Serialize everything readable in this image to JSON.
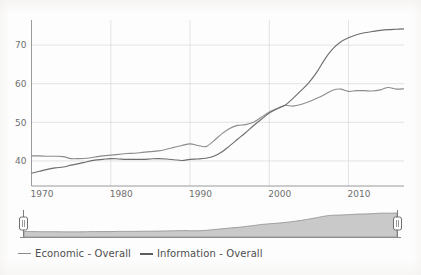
{
  "chart_data": {
    "type": "line",
    "title": "",
    "subtitle": "",
    "xlabel": "",
    "ylabel": "",
    "xlim": [
      1970,
      2017
    ],
    "ylim": [
      33.5,
      76.5
    ],
    "grid": true,
    "legend_position": "bottom-left",
    "x_ticks": [
      "1970",
      "1980",
      "1990",
      "2000",
      "2010"
    ],
    "x_tick_values": [
      1970,
      1980,
      1990,
      2000,
      2010
    ],
    "y_ticks": [
      "40",
      "50",
      "60",
      "70"
    ],
    "y_tick_values": [
      40,
      50,
      60,
      70
    ],
    "x": [
      1970,
      1971,
      1972,
      1973,
      1974,
      1975,
      1976,
      1977,
      1978,
      1979,
      1980,
      1981,
      1982,
      1983,
      1984,
      1985,
      1986,
      1987,
      1988,
      1989,
      1990,
      1991,
      1992,
      1993,
      1994,
      1995,
      1996,
      1997,
      1998,
      1999,
      2000,
      2001,
      2002,
      2003,
      2004,
      2005,
      2006,
      2007,
      2008,
      2009,
      2010,
      2011,
      2012,
      2013,
      2014,
      2015,
      2016,
      2017
    ],
    "series": [
      {
        "name": "Economic - Overall",
        "color": "#8c8c8c",
        "width": 1.1,
        "values": [
          41.3,
          41.3,
          41.2,
          41.2,
          41.1,
          40.6,
          40.6,
          40.7,
          41.0,
          41.3,
          41.5,
          41.7,
          41.9,
          42.0,
          42.2,
          42.4,
          42.6,
          43.0,
          43.5,
          44.0,
          44.4,
          44.0,
          43.7,
          45.2,
          47.0,
          48.4,
          49.2,
          49.4,
          50.0,
          51.3,
          52.7,
          53.6,
          54.4,
          54.2,
          54.6,
          55.3,
          56.2,
          57.2,
          58.3,
          58.6,
          58.0,
          58.2,
          58.2,
          58.1,
          58.4,
          59.0,
          58.6,
          58.7
        ]
      },
      {
        "name": "Information - Overall",
        "color": "#6d6d6d",
        "width": 1.2,
        "values": [
          36.8,
          37.3,
          37.8,
          38.2,
          38.4,
          38.9,
          39.3,
          39.8,
          40.2,
          40.4,
          40.6,
          40.5,
          40.4,
          40.4,
          40.4,
          40.5,
          40.6,
          40.5,
          40.3,
          40.1,
          40.4,
          40.5,
          40.7,
          41.2,
          42.3,
          43.9,
          45.6,
          47.3,
          49.1,
          50.8,
          52.4,
          53.5,
          54.4,
          56.2,
          58.2,
          60.3,
          63.0,
          66.3,
          69.0,
          70.8,
          71.9,
          72.7,
          73.2,
          73.5,
          73.8,
          74.0,
          74.1,
          74.2
        ]
      }
    ]
  },
  "legend": {
    "items": [
      {
        "label": "Economic - Overall",
        "marker_color": "#8a8a8a",
        "marker_style": "thin"
      },
      {
        "label": "Information - Overall",
        "marker_color": "#5d5d5d",
        "marker_style": "thick"
      }
    ]
  },
  "range_slider": {
    "name": "time-range-slider",
    "left_handle_label": "",
    "right_handle_label": "",
    "selection_start": "1970",
    "selection_end": "2017",
    "overview_values": [
      3.5,
      3.5,
      3.4,
      3.4,
      3.4,
      3.3,
      3.3,
      3.3,
      3.4,
      3.5,
      3.5,
      3.5,
      3.6,
      3.6,
      3.6,
      3.7,
      3.7,
      3.8,
      3.9,
      4.0,
      4.1,
      4.0,
      4.0,
      4.3,
      4.8,
      5.3,
      5.8,
      6.2,
      6.8,
      7.4,
      8.1,
      8.5,
      8.9,
      9.4,
      10.0,
      10.7,
      11.6,
      12.5,
      13.5,
      14.0,
      14.1,
      14.4,
      14.7,
      14.8,
      15.0,
      15.3,
      15.3,
      15.4
    ]
  }
}
